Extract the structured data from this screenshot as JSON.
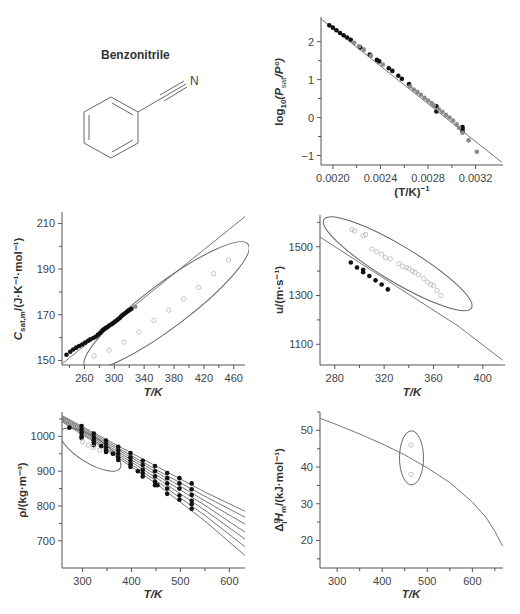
{
  "compound": {
    "name": "Benzonitrile",
    "atom_label": "N"
  },
  "colors": {
    "axis": "#555555",
    "curve": "#777777",
    "filled": "#111111",
    "gray": "#8a8a8a",
    "open": "#bdbdbd",
    "ellipse": "#666666"
  },
  "chart_data": [
    {
      "id": "vapor_pressure",
      "type": "scatter",
      "title": "",
      "xlabel": "(T/K)^-1",
      "ylabel": "log10(Psat/P°)",
      "xlim": [
        0.0019,
        0.00343
      ],
      "ylim": [
        -1.25,
        2.65
      ],
      "xticks": [
        0.002,
        0.0024,
        0.0028,
        0.0032
      ],
      "xtick_labels": [
        "0.0020",
        "0.0024",
        "0.0028",
        "0.0032"
      ],
      "yticks": [
        -1,
        0,
        1,
        2
      ],
      "yminor": [
        -0.5,
        0.5,
        1.5
      ],
      "xminor": [
        0.0022,
        0.0026,
        0.003
      ],
      "fit_line": {
        "x": [
          0.0019,
          0.00342
        ],
        "y": [
          2.6,
          -1.18
        ]
      },
      "series": [
        {
          "name": "filled",
          "style": "filled",
          "x": [
            0.00197,
            0.002,
            0.00203,
            0.00206,
            0.00209,
            0.00212,
            0.00215,
            0.00223,
            0.00231,
            0.00237,
            0.00239,
            0.00247,
            0.0025,
            0.00255,
            0.00258,
            0.00264,
            0.00287,
            0.00287,
            0.00309,
            0.00309,
            0.00309
          ],
          "y": [
            2.43,
            2.37,
            2.3,
            2.23,
            2.17,
            2.11,
            2.05,
            1.85,
            1.66,
            1.52,
            1.48,
            1.3,
            1.23,
            1.1,
            1.02,
            0.88,
            0.3,
            0.16,
            -0.25,
            -0.3,
            -0.36
          ]
        },
        {
          "name": "gray",
          "style": "gray",
          "x": [
            0.00218,
            0.00222,
            0.00226,
            0.00232,
            0.00242,
            0.00265,
            0.00268,
            0.00271,
            0.00274,
            0.00277,
            0.0028,
            0.00283,
            0.00285,
            0.00289,
            0.00292,
            0.00295,
            0.00298,
            0.00301,
            0.00304,
            0.00306,
            0.00309,
            0.00314,
            0.00321
          ],
          "y": [
            1.97,
            1.88,
            1.79,
            1.63,
            1.4,
            0.82,
            0.74,
            0.67,
            0.6,
            0.52,
            0.45,
            0.38,
            0.32,
            0.22,
            0.15,
            0.07,
            0.0,
            -0.08,
            -0.18,
            -0.27,
            -0.4,
            -0.6,
            -0.9
          ]
        }
      ]
    },
    {
      "id": "heat_capacity",
      "type": "scatter",
      "xlabel": "T/K",
      "ylabel": "Csat,m/(J·K⁻¹·mol⁻¹)",
      "xlim": [
        230,
        475
      ],
      "ylim": [
        148,
        215
      ],
      "xticks": [
        260,
        300,
        340,
        380,
        420,
        460
      ],
      "xminor": [
        240,
        280,
        320,
        360,
        400,
        440
      ],
      "yticks": [
        150,
        170,
        190,
        210
      ],
      "yminor": [
        160,
        180,
        200
      ],
      "fit_line": {
        "x": [
          230,
          475
        ],
        "y": [
          148.5,
          213
        ]
      },
      "ellipse": {
        "cx": 370,
        "cy": 174,
        "rx_px": 102,
        "ry_px": 22,
        "rotate": -37
      },
      "series": [
        {
          "name": "filled",
          "style": "filled",
          "x": [
            236,
            241,
            245,
            249,
            253,
            257,
            261,
            265,
            268,
            272,
            275,
            278,
            281,
            283,
            285,
            287,
            289,
            291,
            293,
            295,
            297,
            299,
            301,
            303,
            305,
            307,
            309,
            311,
            313,
            315,
            317,
            319,
            321,
            323
          ],
          "y": [
            152.5,
            153.8,
            154.8,
            155.6,
            156.3,
            157.0,
            157.8,
            158.6,
            159.2,
            159.8,
            160.4,
            161.2,
            162.0,
            162.8,
            163.4,
            163.8,
            164.3,
            164.6,
            165.2,
            165.6,
            166.0,
            166.5,
            167.0,
            167.5,
            168.0,
            168.5,
            169.2,
            169.8,
            170.3,
            170.8,
            171.3,
            171.8,
            172.2,
            172.6
          ]
        },
        {
          "name": "gray",
          "style": "gray",
          "x": [
            328
          ],
          "y": [
            173.5
          ]
        },
        {
          "name": "open",
          "style": "open",
          "x": [
            273,
            293,
            313,
            333,
            353,
            373,
            393,
            413,
            433,
            453
          ],
          "y": [
            152,
            154.5,
            158,
            162.5,
            167.5,
            172,
            177,
            182,
            188,
            194
          ]
        }
      ]
    },
    {
      "id": "speed_of_sound",
      "type": "scatter",
      "xlabel": "T/K",
      "ylabel": "u/(m·s⁻¹)",
      "xlim": [
        268,
        418
      ],
      "ylim": [
        1015,
        1630
      ],
      "xticks": [
        280,
        320,
        360,
        400
      ],
      "xminor": [
        300,
        340,
        380
      ],
      "yticks": [
        1100,
        1300,
        1500
      ],
      "yminor": [
        1200,
        1400,
        1600
      ],
      "fit_line": {
        "x": [
          268,
          300,
          340,
          380,
          416
        ],
        "y": [
          1540,
          1435,
          1305,
          1175,
          1035
        ]
      },
      "ellipse": {
        "cx": 331,
        "cy": 1430,
        "rx_px": 86,
        "ry_px": 18,
        "rotate": 31
      },
      "series": [
        {
          "name": "filled",
          "style": "filled",
          "x": [
            293,
            298,
            303,
            303,
            308,
            313,
            318,
            323
          ],
          "y": [
            1435,
            1415,
            1405,
            1395,
            1380,
            1362,
            1345,
            1325
          ]
        },
        {
          "name": "open",
          "style": "open",
          "x": [
            294,
            296,
            303,
            305,
            310,
            314,
            318,
            321,
            325,
            332,
            335,
            338,
            340,
            343,
            345,
            348,
            352,
            355,
            358,
            360,
            363,
            366
          ],
          "y": [
            1570,
            1565,
            1545,
            1550,
            1490,
            1480,
            1470,
            1455,
            1450,
            1430,
            1420,
            1415,
            1410,
            1400,
            1395,
            1385,
            1370,
            1355,
            1345,
            1340,
            1320,
            1300
          ]
        }
      ]
    },
    {
      "id": "density",
      "type": "scatter",
      "xlabel": "T/K",
      "ylabel": "ρ/(kg·m⁻³)",
      "xlim": [
        258,
        632
      ],
      "ylim": [
        622,
        1070
      ],
      "xticks": [
        300,
        400,
        500,
        600
      ],
      "xminor": [
        350,
        450,
        550
      ],
      "yticks": [
        700,
        800,
        900,
        1000
      ],
      "yminor": [
        750,
        850,
        950,
        1050
      ],
      "isobars": [
        {
          "x": [
            258,
            350,
            450,
            550,
            632
          ],
          "y": [
            1060,
            990,
            915,
            840,
            785
          ]
        },
        {
          "x": [
            258,
            350,
            450,
            550,
            632
          ],
          "y": [
            1057,
            985,
            905,
            828,
            768
          ]
        },
        {
          "x": [
            258,
            350,
            450,
            550,
            632
          ],
          "y": [
            1054,
            980,
            898,
            815,
            748
          ]
        },
        {
          "x": [
            258,
            350,
            450,
            550,
            632
          ],
          "y": [
            1051,
            975,
            890,
            802,
            725
          ]
        },
        {
          "x": [
            258,
            350,
            450,
            550,
            632
          ],
          "y": [
            1048,
            970,
            882,
            788,
            705
          ]
        },
        {
          "x": [
            258,
            350,
            450,
            550,
            632
          ],
          "y": [
            1045,
            965,
            873,
            773,
            683
          ]
        },
        {
          "x": [
            258,
            350,
            450,
            550,
            632
          ],
          "y": [
            1042,
            960,
            865,
            757,
            658
          ]
        }
      ],
      "ellipse": {
        "cx": 316,
        "cy": 962,
        "rx_px": 35,
        "ry_px": 13,
        "rotate": 32
      },
      "series": [
        {
          "name": "filled",
          "style": "filled",
          "x": [
            273,
            298,
            298,
            298,
            298,
            298,
            323,
            323,
            323,
            323,
            323,
            338,
            348,
            348,
            348,
            348,
            348,
            362,
            373,
            373,
            373,
            373,
            373,
            398,
            398,
            398,
            398,
            398,
            413,
            423,
            423,
            423,
            423,
            423,
            448,
            448,
            448,
            448,
            448,
            453,
            473,
            473,
            473,
            473,
            473,
            498,
            498,
            498,
            498,
            498,
            523,
            523,
            523,
            523,
            523,
            523
          ],
          "y": [
            1025,
            1030,
            1020,
            1010,
            1000,
            995,
            1008,
            998,
            990,
            983,
            975,
            972,
            988,
            978,
            968,
            960,
            955,
            950,
            970,
            960,
            950,
            940,
            932,
            952,
            940,
            930,
            920,
            912,
            900,
            930,
            918,
            905,
            895,
            885,
            915,
            900,
            885,
            870,
            860,
            860,
            895,
            880,
            865,
            850,
            835,
            880,
            865,
            850,
            830,
            818,
            865,
            848,
            832,
            815,
            805,
            792
          ]
        },
        {
          "name": "open",
          "style": "open",
          "x": [
            300,
            312,
            322,
            335
          ],
          "y": [
            985,
            975,
            968,
            960
          ]
        }
      ]
    },
    {
      "id": "enthalpy_vaporization",
      "type": "line",
      "xlabel": "T/K",
      "ylabel": "ΔlgHm/(kJ·mol⁻¹)",
      "xlim": [
        262,
        668
      ],
      "ylim": [
        12.5,
        55
      ],
      "xticks": [
        300,
        400,
        500,
        600
      ],
      "xminor": [
        350,
        450,
        550,
        650
      ],
      "yticks": [
        20,
        30,
        40,
        50
      ],
      "yminor": [
        15,
        25,
        35,
        45,
        55
      ],
      "fit_line": {
        "x": [
          262,
          300,
          350,
          400,
          450,
          500,
          550,
          600,
          630,
          650,
          667
        ],
        "y": [
          53.3,
          51.5,
          49.0,
          46.3,
          43.3,
          39.8,
          35.8,
          30.5,
          26.3,
          22.5,
          18.5
        ]
      },
      "ellipse": {
        "cx": 465,
        "cy": 42.5,
        "rx_px": 12,
        "ry_px": 27,
        "rotate": 0
      },
      "series": [
        {
          "name": "open",
          "style": "open",
          "x": [
            464,
            464
          ],
          "y": [
            46,
            38
          ]
        }
      ]
    }
  ],
  "panels": {
    "vapor_pressure": {
      "xlabel": "(T/K)",
      "xlabel_sup": "−1",
      "ylabel_pre": "log",
      "ylabel_sub": "10",
      "ylabel_mid": "(P",
      "ylabel_sub2": "sat",
      "ylabel_post": "/P°)"
    },
    "heat_capacity": {
      "xlabel": "T/K",
      "ylabel_pre": "C",
      "ylabel_sub": "sat,m",
      "ylabel_post": "/(J·K⁻¹·mol⁻¹)"
    },
    "speed_of_sound": {
      "xlabel": "T/K",
      "ylabel": "u/(m·s⁻¹)"
    },
    "density": {
      "xlabel": "T/K",
      "ylabel": "ρ/(kg·m⁻³)"
    },
    "enthalpy": {
      "xlabel": "T/K",
      "ylabel_pre": "Δ",
      "ylabel_sup": "g",
      "ylabel_sub": "l",
      "ylabel_mid": "H",
      "ylabel_sub2": "m",
      "ylabel_post": "/(kJ·mol⁻¹)"
    }
  }
}
